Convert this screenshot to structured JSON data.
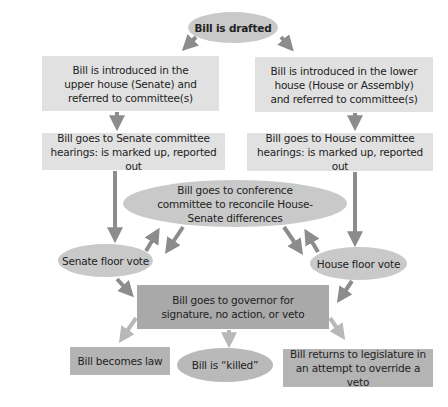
{
  "diagram": {
    "nodes": {
      "drafted": "Bill is drafted",
      "upper_intro": "Bill is introduced in the upper house (Senate) and referred to committee(s)",
      "lower_intro": "Bill is introduced in the lower house (House or Assembly) and referred to committee(s)",
      "senate_committee": "Bill goes to Senate committee hearings: is marked up, reported out",
      "house_committee": "Bill goes to House committee hearings: is marked up, reported out",
      "conference": "Bill goes to conference committee to reconcile House-Senate differences",
      "senate_floor": "Senate floor vote",
      "house_floor": "House floor vote",
      "governor": "Bill goes to governor for signature, no action, or veto",
      "law": "Bill becomes law",
      "killed": "Bill is “killed”",
      "override": "Bill returns to legislature in an attempt to override a veto"
    },
    "edges": [
      [
        "drafted",
        "upper_intro"
      ],
      [
        "drafted",
        "lower_intro"
      ],
      [
        "upper_intro",
        "senate_committee"
      ],
      [
        "lower_intro",
        "house_committee"
      ],
      [
        "senate_committee",
        "senate_floor"
      ],
      [
        "house_committee",
        "house_floor"
      ],
      [
        "senate_floor",
        "conference"
      ],
      [
        "conference",
        "senate_floor"
      ],
      [
        "house_floor",
        "conference"
      ],
      [
        "conference",
        "house_floor"
      ],
      [
        "senate_floor",
        "governor"
      ],
      [
        "house_floor",
        "governor"
      ],
      [
        "governor",
        "law"
      ],
      [
        "governor",
        "killed"
      ],
      [
        "governor",
        "override"
      ]
    ],
    "colors": {
      "box_light": "#e1e1e1",
      "ellipse": "#c9c9c9",
      "governor_box": "#a9a9a9",
      "outcome_box": "#b4b4b4",
      "arrow_dark": "#8c8c8c",
      "arrow_light": "#b8b8b8",
      "text": "#222222"
    }
  }
}
